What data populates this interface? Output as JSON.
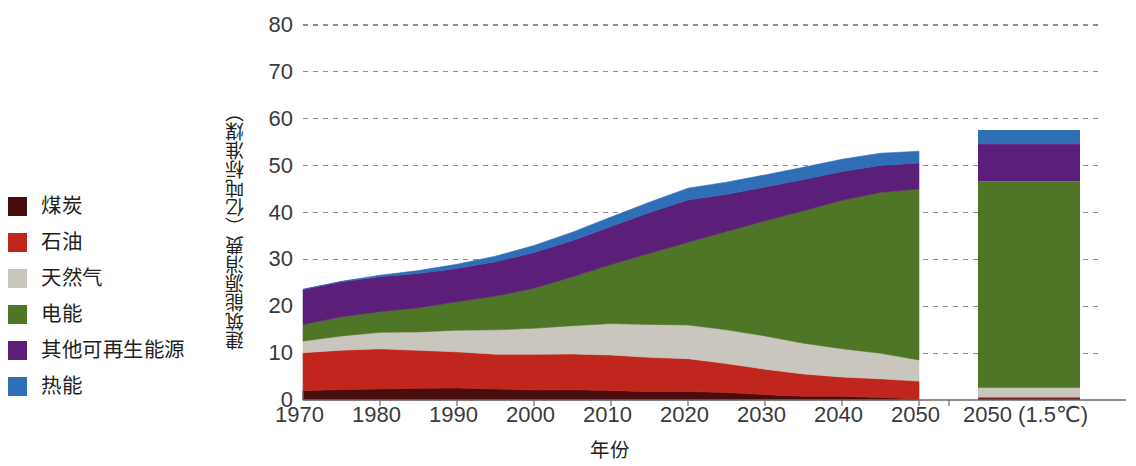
{
  "legend": {
    "items": [
      {
        "label": "煤炭",
        "key": "coal",
        "color": "#4a0d0d"
      },
      {
        "label": "石油",
        "key": "oil",
        "color": "#c0261d"
      },
      {
        "label": "天然气",
        "key": "gas",
        "color": "#c9c6bd"
      },
      {
        "label": "电能",
        "key": "electricity",
        "color": "#4f7526"
      },
      {
        "label": "其他可再生能源",
        "key": "renewables",
        "color": "#5b1f7a"
      },
      {
        "label": "热能",
        "key": "heat",
        "color": "#2e6fb7"
      }
    ]
  },
  "axes": {
    "y_title": "建筑能源消费（亿吨标准煤）",
    "x_title": "年份",
    "y_ticks": [
      "0",
      "10",
      "20",
      "30",
      "40",
      "50",
      "60",
      "70",
      "80"
    ],
    "x_ticks": [
      "1970",
      "1980",
      "1990",
      "2000",
      "2010",
      "2020",
      "2030",
      "2040",
      "2050"
    ],
    "scenario_tick": "2050 (1.5℃)"
  },
  "chart_data": {
    "type": "area",
    "title": "",
    "xlabel": "年份",
    "ylabel": "建筑能源消费（亿吨标准煤）",
    "xlim": [
      1970,
      2050
    ],
    "ylim": [
      0,
      80
    ],
    "grid": true,
    "legend_position": "left",
    "stacking": "stacked",
    "x": [
      1970,
      1975,
      1980,
      1985,
      1990,
      1995,
      2000,
      2005,
      2010,
      2015,
      2020,
      2025,
      2030,
      2035,
      2040,
      2045,
      2050
    ],
    "series": [
      {
        "name": "煤炭",
        "color": "#4a0d0d",
        "values": [
          2.0,
          2.2,
          2.4,
          2.5,
          2.5,
          2.4,
          2.2,
          2.1,
          2.0,
          1.9,
          1.8,
          1.5,
          1.2,
          0.9,
          0.7,
          0.5,
          0.3
        ]
      },
      {
        "name": "石油",
        "color": "#c0261d",
        "values": [
          8.0,
          8.5,
          8.6,
          8.0,
          7.7,
          7.5,
          7.6,
          7.6,
          7.6,
          7.3,
          7.0,
          6.2,
          5.4,
          4.7,
          4.2,
          4.0,
          3.7
        ]
      },
      {
        "name": "天然气",
        "color": "#c9c6bd",
        "values": [
          2.5,
          3.0,
          3.5,
          4.0,
          4.6,
          5.1,
          5.6,
          6.1,
          6.6,
          7.0,
          7.3,
          7.2,
          7.0,
          6.6,
          6.1,
          5.4,
          4.5
        ]
      },
      {
        "name": "电能",
        "color": "#4f7526",
        "values": [
          3.5,
          4.0,
          4.5,
          5.2,
          6.0,
          7.2,
          8.6,
          10.4,
          12.6,
          15.2,
          17.6,
          21.0,
          24.6,
          28.2,
          31.6,
          34.4,
          36.5
        ]
      },
      {
        "name": "其他可再生能源",
        "color": "#5b1f7a",
        "values": [
          7.5,
          7.5,
          7.4,
          7.3,
          7.2,
          7.3,
          7.5,
          7.8,
          8.2,
          8.6,
          9.0,
          8.0,
          7.2,
          6.6,
          6.2,
          5.8,
          5.5
        ]
      },
      {
        "name": "热能",
        "color": "#2e6fb7",
        "values": [
          0.0,
          0.1,
          0.3,
          0.6,
          0.9,
          1.2,
          1.5,
          1.8,
          2.0,
          2.2,
          2.5,
          2.6,
          2.6,
          2.6,
          2.6,
          2.6,
          2.5
        ]
      }
    ],
    "totals": [
      23.5,
      25.3,
      26.7,
      27.6,
      28.9,
      30.7,
      33.0,
      35.8,
      39.0,
      42.2,
      45.2,
      46.5,
      48.0,
      49.6,
      51.4,
      52.7,
      53.0
    ],
    "scenario_bar": {
      "label": "2050 (1.5℃)",
      "values": {
        "煤炭": 0.4,
        "石油": 0.2,
        "天然气": 2.0,
        "电能": 44.0,
        "其他可再生能源": 8.0,
        "热能": 3.0
      },
      "total": 57.6
    }
  }
}
